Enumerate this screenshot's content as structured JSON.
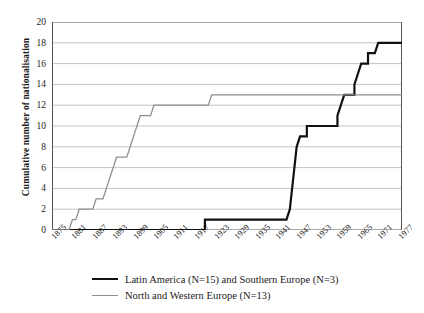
{
  "chart_data": {
    "type": "line",
    "title": "",
    "xlabel": "",
    "ylabel": "Cumulative number of nationalisation",
    "xlim": [
      1875,
      1978
    ],
    "ylim": [
      0,
      20
    ],
    "ytick_step": 2,
    "xtick_step": 6,
    "grid": true,
    "legend_position": "bottom",
    "ytick_labels": [
      "0",
      "2",
      "4",
      "6",
      "8",
      "10",
      "12",
      "14",
      "16",
      "18",
      "20"
    ],
    "xtick_labels": [
      "1875",
      "1881",
      "1887",
      "1893",
      "1899",
      "1905",
      "1911",
      "1917",
      "1923",
      "1929",
      "1935",
      "1941",
      "1947",
      "1953",
      "1959",
      "1965",
      "1971",
      "1977"
    ],
    "series": [
      {
        "name": "Latin America (N=15) and Southern Europe (N=3)",
        "color": "#111111",
        "width": 2.2,
        "points": [
          [
            1875,
            0
          ],
          [
            1920,
            0
          ],
          [
            1920,
            1
          ],
          [
            1944,
            1
          ],
          [
            1945,
            2
          ],
          [
            1946,
            5
          ],
          [
            1947,
            8
          ],
          [
            1948,
            9
          ],
          [
            1950,
            9
          ],
          [
            1950,
            10
          ],
          [
            1954,
            10
          ],
          [
            1955,
            10
          ],
          [
            1959,
            10
          ],
          [
            1959,
            11
          ],
          [
            1960,
            12
          ],
          [
            1961,
            13
          ],
          [
            1964,
            13
          ],
          [
            1964,
            14
          ],
          [
            1965,
            15
          ],
          [
            1966,
            16
          ],
          [
            1968,
            16
          ],
          [
            1968,
            17
          ],
          [
            1970,
            17
          ],
          [
            1971,
            18
          ],
          [
            1978,
            18
          ]
        ]
      },
      {
        "name": "North and Western Europe (N=13)",
        "color": "#8e8e8e",
        "width": 1.3,
        "points": [
          [
            1875,
            0
          ],
          [
            1880,
            0
          ],
          [
            1881,
            1
          ],
          [
            1882,
            1
          ],
          [
            1883,
            2
          ],
          [
            1887,
            2
          ],
          [
            1888,
            3
          ],
          [
            1890,
            3
          ],
          [
            1891,
            4
          ],
          [
            1892,
            5
          ],
          [
            1893,
            6
          ],
          [
            1894,
            7
          ],
          [
            1897,
            7
          ],
          [
            1898,
            8
          ],
          [
            1899,
            9
          ],
          [
            1900,
            10
          ],
          [
            1901,
            11
          ],
          [
            1904,
            11
          ],
          [
            1905,
            12
          ],
          [
            1921,
            12
          ],
          [
            1922,
            13
          ],
          [
            1978,
            13
          ]
        ]
      }
    ]
  },
  "legend": {
    "entries": [
      {
        "label": "Latin America (N=15) and Southern Europe (N=3)",
        "style": "black"
      },
      {
        "label": "North and Western Europe (N=13)",
        "style": "grey"
      }
    ]
  }
}
